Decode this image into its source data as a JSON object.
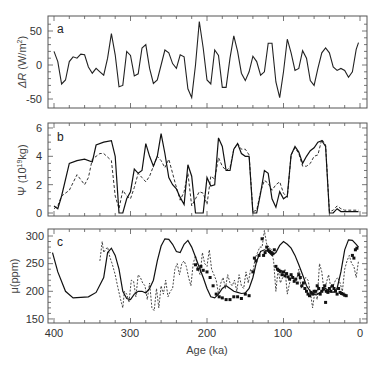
{
  "chart_data": [
    {
      "type": "line",
      "panel_label": "a",
      "xlabel": "",
      "ylabel": "ΔR (W/m²)",
      "xlim": [
        400,
        0
      ],
      "ylim": [
        -65,
        70
      ],
      "yticks": [
        50,
        0,
        -50
      ],
      "series": [
        {
          "name": "insolation anomaly",
          "style": "solid",
          "x": [
            400,
            395,
            390,
            385,
            380,
            375,
            370,
            365,
            360,
            355,
            350,
            345,
            340,
            335,
            330,
            325,
            320,
            315,
            310,
            305,
            300,
            295,
            290,
            285,
            280,
            275,
            270,
            265,
            260,
            255,
            250,
            245,
            240,
            235,
            230,
            225,
            220,
            215,
            210,
            205,
            200,
            195,
            190,
            185,
            180,
            175,
            170,
            165,
            160,
            155,
            150,
            145,
            140,
            135,
            130,
            125,
            120,
            115,
            110,
            105,
            100,
            95,
            90,
            85,
            80,
            75,
            70,
            65,
            60,
            55,
            50,
            45,
            40,
            35,
            30,
            25,
            20,
            15,
            10,
            5,
            2
          ],
          "values": [
            20,
            5,
            -28,
            -22,
            5,
            12,
            10,
            16,
            15,
            -3,
            -12,
            -5,
            -10,
            -15,
            10,
            46,
            15,
            -32,
            -30,
            20,
            14,
            -16,
            -13,
            25,
            30,
            -5,
            -27,
            -22,
            0,
            22,
            18,
            2,
            -5,
            15,
            12,
            -35,
            -48,
            0,
            64,
            25,
            -22,
            -28,
            22,
            14,
            -33,
            -33,
            10,
            43,
            20,
            -12,
            -23,
            -10,
            13,
            5,
            -15,
            -10,
            32,
            32,
            -25,
            -48,
            -10,
            38,
            18,
            -8,
            -5,
            21,
            10,
            -23,
            -30,
            -5,
            18,
            25,
            18,
            -3,
            -8,
            -5,
            -8,
            -18,
            -10,
            23,
            33,
            5
          ]
        }
      ]
    },
    {
      "type": "line",
      "panel_label": "b",
      "xlabel": "",
      "ylabel": "Ψ (10¹⁹kg)",
      "xlim": [
        400,
        0
      ],
      "ylim": [
        -0.3,
        6.3
      ],
      "yticks": [
        6,
        4,
        2,
        0
      ],
      "series": [
        {
          "name": "model (solid)",
          "style": "solid",
          "x": [
            400,
            395,
            390,
            380,
            370,
            360,
            350,
            345,
            335,
            325,
            320,
            315,
            310,
            305,
            300,
            295,
            290,
            285,
            280,
            275,
            270,
            265,
            260,
            255,
            250,
            245,
            240,
            235,
            230,
            225,
            220,
            215,
            210,
            205,
            200,
            195,
            190,
            185,
            180,
            175,
            170,
            165,
            160,
            155,
            150,
            145,
            140,
            135,
            130,
            125,
            120,
            115,
            110,
            105,
            100,
            95,
            90,
            85,
            80,
            75,
            70,
            65,
            60,
            55,
            50,
            45,
            40,
            35,
            30,
            25,
            20,
            15,
            12,
            8,
            5,
            2
          ],
          "values": [
            0.5,
            0.3,
            1.2,
            3.5,
            3.7,
            3.8,
            3.6,
            4.8,
            5.0,
            5.1,
            4.0,
            0.0,
            0.0,
            1.0,
            1.5,
            3.1,
            2.8,
            3.0,
            4.9,
            4.0,
            3.3,
            4.0,
            5.6,
            4.2,
            2.5,
            2.0,
            1.7,
            1.1,
            0.6,
            3.4,
            2.6,
            0.0,
            0.0,
            0.0,
            2.5,
            1.9,
            2.0,
            5.3,
            4.7,
            3.0,
            3.0,
            4.5,
            4.9,
            4.2,
            4.0,
            4.0,
            0.0,
            0.0,
            1.4,
            3.0,
            2.8,
            1.0,
            0.4,
            1.5,
            1.0,
            1.2,
            4.1,
            4.7,
            4.3,
            3.5,
            4.0,
            4.4,
            4.6,
            5.0,
            5.1,
            4.7,
            0.0,
            0.0,
            0.3,
            0.1,
            0.1,
            0.1,
            0.1,
            0.1,
            0.1,
            0.1
          ]
        },
        {
          "name": "model (dashed)",
          "style": "dashed",
          "x": [
            400,
            395,
            390,
            380,
            370,
            360,
            355,
            350,
            340,
            335,
            325,
            320,
            315,
            310,
            305,
            300,
            295,
            290,
            285,
            280,
            275,
            270,
            265,
            260,
            255,
            250,
            245,
            240,
            235,
            230,
            225,
            220,
            215,
            210,
            205,
            200,
            195,
            190,
            185,
            180,
            175,
            170,
            165,
            160,
            155,
            150,
            145,
            140,
            135,
            130,
            125,
            120,
            115,
            110,
            105,
            100,
            95,
            90,
            85,
            80,
            75,
            70,
            65,
            60,
            55,
            50,
            45,
            40,
            35,
            30,
            25,
            20,
            15,
            10,
            5,
            2
          ],
          "values": [
            0.3,
            0.5,
            1.2,
            1.6,
            2.7,
            2.0,
            2.5,
            3.8,
            4.2,
            4.2,
            3.7,
            1.2,
            0.3,
            1.6,
            1.2,
            1.0,
            1.8,
            2.8,
            2.5,
            2.2,
            2.6,
            3.3,
            4.0,
            3.7,
            3.2,
            3.8,
            2.8,
            1.8,
            0.9,
            1.5,
            2.8,
            0.5,
            1.0,
            1.5,
            1.4,
            0.6,
            2.6,
            2.4,
            3.9,
            3.3,
            3.0,
            3.2,
            4.5,
            4.9,
            4.5,
            4.5,
            4.1,
            0.1,
            0.2,
            1.5,
            2.3,
            2.1,
            1.6,
            2.0,
            2.2,
            1.4,
            1.1,
            4.1,
            4.6,
            4.2,
            3.3,
            3.3,
            3.5,
            4.0,
            4.1,
            5.2,
            4.8,
            0.1,
            0.2,
            0.5,
            0.3,
            0.2,
            0.2,
            0.2,
            0.2,
            0.2
          ]
        }
      ]
    },
    {
      "type": "line",
      "panel_label": "c",
      "xlabel": "Age (ka)",
      "ylabel": "μ(ppm)",
      "xlim": [
        400,
        0
      ],
      "ylim": [
        145,
        310
      ],
      "yticks": [
        300,
        250,
        200,
        150
      ],
      "xticks": [
        400,
        300,
        200,
        100,
        0
      ],
      "series": [
        {
          "name": "model CO2 (solid)",
          "style": "solid",
          "x": [
            402,
            395,
            385,
            375,
            365,
            355,
            345,
            335,
            330,
            325,
            320,
            315,
            310,
            305,
            300,
            295,
            290,
            285,
            280,
            275,
            270,
            265,
            260,
            255,
            250,
            245,
            240,
            235,
            230,
            225,
            220,
            215,
            210,
            205,
            200,
            195,
            190,
            185,
            180,
            175,
            170,
            165,
            160,
            155,
            150,
            145,
            140,
            135,
            130,
            125,
            120,
            115,
            110,
            105,
            100,
            95,
            90,
            85,
            80,
            75,
            70,
            65,
            60,
            55,
            50,
            45,
            40,
            35,
            30,
            25,
            20,
            15,
            10,
            5,
            2
          ],
          "values": [
            270,
            235,
            200,
            188,
            189,
            190,
            198,
            225,
            270,
            278,
            265,
            240,
            200,
            187,
            185,
            195,
            200,
            200,
            197,
            205,
            220,
            255,
            282,
            295,
            294,
            285,
            272,
            270,
            285,
            292,
            280,
            262,
            243,
            225,
            205,
            190,
            188,
            195,
            205,
            210,
            205,
            200,
            198,
            196,
            197,
            205,
            225,
            255,
            272,
            275,
            272,
            265,
            270,
            283,
            290,
            285,
            278,
            265,
            248,
            230,
            210,
            200,
            195,
            195,
            200,
            205,
            200,
            198,
            205,
            235,
            275,
            293,
            292,
            285,
            280
          ]
        },
        {
          "name": "Vostok CO2 (dashed)",
          "style": "dashed",
          "x": [
            340,
            337,
            335,
            333,
            330,
            327,
            324,
            320,
            317,
            313,
            310,
            308,
            305,
            302,
            299,
            296,
            293,
            290,
            287,
            284,
            281,
            278,
            275,
            272,
            269,
            266,
            263,
            260,
            257,
            254,
            251,
            248,
            245,
            242,
            239,
            236,
            233,
            230,
            227,
            224,
            221,
            218,
            215,
            212,
            209,
            206,
            203,
            200,
            197,
            194,
            191,
            188,
            185,
            182,
            179,
            176,
            173,
            170,
            167,
            164,
            161,
            158,
            155,
            152,
            149,
            146,
            143,
            140,
            137,
            134,
            131,
            128,
            125,
            122,
            119,
            116,
            113,
            110,
            107,
            104,
            101,
            98,
            95,
            92,
            89,
            86,
            83,
            80,
            77,
            74,
            71,
            68,
            65,
            62,
            59,
            56,
            53,
            50,
            47,
            44,
            41,
            38,
            35,
            32,
            29,
            26,
            23,
            20,
            17,
            14,
            11,
            8,
            5,
            2
          ],
          "values": [
            255,
            290,
            270,
            275,
            280,
            262,
            250,
            230,
            210,
            185,
            170,
            200,
            195,
            180,
            220,
            218,
            190,
            230,
            225,
            215,
            210,
            185,
            215,
            170,
            165,
            205,
            170,
            210,
            195,
            220,
            190,
            200,
            205,
            240,
            250,
            230,
            250,
            255,
            245,
            225,
            210,
            250,
            265,
            240,
            230,
            270,
            250,
            245,
            275,
            240,
            230,
            220,
            195,
            215,
            225,
            205,
            230,
            215,
            210,
            220,
            200,
            230,
            210,
            205,
            235,
            215,
            240,
            235,
            260,
            270,
            280,
            280,
            310,
            285,
            280,
            275,
            255,
            200,
            240,
            215,
            225,
            240,
            195,
            215,
            230,
            220,
            220,
            240,
            205,
            215,
            225,
            220,
            200,
            170,
            200,
            185,
            250,
            235,
            200,
            215,
            230,
            205,
            210,
            220,
            225,
            215,
            200,
            240,
            255,
            265,
            250,
            245,
            225,
            255
          ]
        },
        {
          "name": "data (squares)",
          "style": "markers",
          "x": [
            136,
            132,
            128,
            126,
            124,
            122,
            120,
            118,
            116,
            114,
            112,
            110,
            108,
            106,
            104,
            102,
            100,
            98,
            96,
            94,
            92,
            90,
            88,
            86,
            84,
            82,
            80,
            78,
            76,
            74,
            72,
            70,
            68,
            66,
            64,
            62,
            60,
            58,
            56,
            54,
            52,
            50,
            48,
            46,
            44,
            42,
            40,
            38,
            36,
            34,
            32,
            30,
            28,
            26,
            24,
            22,
            20,
            18,
            180,
            175,
            170,
            165,
            160,
            155,
            150,
            145,
            215,
            212,
            208,
            205,
            200,
            196,
            192,
            188,
            184,
            140,
            138,
            45,
            10,
            8,
            6,
            4
          ],
          "values": [
            255,
            265,
            295,
            265,
            270,
            280,
            275,
            272,
            270,
            268,
            275,
            245,
            240,
            238,
            236,
            230,
            235,
            228,
            232,
            226,
            222,
            230,
            225,
            218,
            222,
            215,
            230,
            225,
            210,
            215,
            205,
            200,
            195,
            192,
            198,
            195,
            200,
            200,
            210,
            205,
            195,
            200,
            205,
            210,
            200,
            198,
            205,
            200,
            210,
            205,
            200,
            195,
            205,
            198,
            196,
            195,
            193,
            192,
            188,
            185,
            185,
            190,
            190,
            187,
            195,
            192,
            248,
            240,
            245,
            238,
            235,
            225,
            210,
            195,
            190,
            235,
            260,
            180,
            265,
            260,
            275,
            278
          ]
        }
      ]
    }
  ],
  "panels": {
    "a": {
      "label": "a",
      "ylabel_prefix": "ΔR",
      "ylabel_unit": " (W/m",
      "ylabel_sup": "2",
      "ylabel_end": ")",
      "yticks": [
        "50",
        "0",
        "-50"
      ]
    },
    "b": {
      "label": "b",
      "ylabel_prefix": "Ψ",
      "ylabel_unit": "  (10",
      "ylabel_sup": "19",
      "ylabel_end": "kg)",
      "yticks": [
        "6",
        "4",
        "2",
        "0"
      ]
    },
    "c": {
      "label": "c",
      "ylabel": "μ(ppm)",
      "yticks": [
        "300",
        "250",
        "200",
        "150"
      ]
    }
  },
  "xaxis": {
    "ticks": [
      "400",
      "300",
      "200",
      "100",
      "0"
    ],
    "label": "Age (ka)"
  }
}
